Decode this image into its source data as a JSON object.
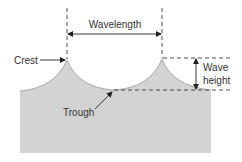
{
  "diagram": {
    "labels": {
      "wavelength": "Wavelength",
      "crest": "Crest",
      "trough": "Trough",
      "wave_height_line1": "Wave",
      "wave_height_line2": "height"
    },
    "colors": {
      "water": "#d3d3d3",
      "water_edge": "#a8a8a8",
      "line": "#222222",
      "text": "#333333",
      "background": "#ffffff"
    }
  }
}
